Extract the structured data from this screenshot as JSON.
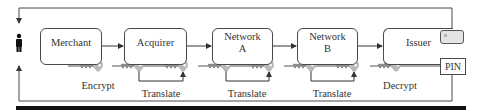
{
  "diagram": {
    "nodes": [
      {
        "id": "merchant",
        "label": "Merchant"
      },
      {
        "id": "acquirer",
        "label": "Acquirer"
      },
      {
        "id": "network_a",
        "label": "Network A",
        "line1": "Network",
        "line2": "A"
      },
      {
        "id": "network_b",
        "label": "Network B",
        "line1": "Network",
        "line2": "B"
      },
      {
        "id": "issuer",
        "label": "Issuer"
      }
    ],
    "operations": [
      {
        "label": "Encrypt",
        "under": "merchant"
      },
      {
        "label": "Translate",
        "under": "acquirer"
      },
      {
        "label": "Translate",
        "under": "network_a"
      },
      {
        "label": "Translate",
        "under": "network_b"
      },
      {
        "label": "Decrypt",
        "under": "issuer"
      }
    ],
    "pin_box": {
      "label": "PIN"
    },
    "icons": {
      "cardholder": "person-icon",
      "card": "card-icon",
      "keys": "key-icon"
    },
    "edges": [
      {
        "from": "merchant",
        "to": "acquirer"
      },
      {
        "from": "acquirer",
        "to": "network_a"
      },
      {
        "from": "network_a",
        "to": "network_b"
      },
      {
        "from": "network_b",
        "to": "issuer"
      },
      {
        "from": "card",
        "to": "cardholder",
        "route": "top"
      },
      {
        "from": "pin",
        "to": "cardholder",
        "route": "bottom"
      }
    ],
    "colors": {
      "line": "#4a4a4a",
      "key_light": "#b9b9b9",
      "key_dark": "#8c8c8c",
      "rule": "#111111"
    }
  }
}
